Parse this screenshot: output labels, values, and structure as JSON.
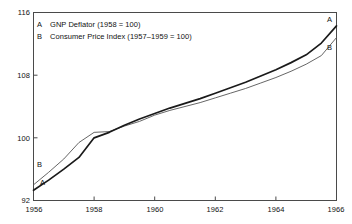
{
  "chart_data": {
    "type": "line",
    "title": "",
    "subtitle": "",
    "xlabel": "",
    "ylabel": "",
    "xlim": [
      1956,
      1966
    ],
    "ylim": [
      92,
      116
    ],
    "grid": false,
    "legend_position": "inside-top-left",
    "x_ticks": [
      "1956",
      "1958",
      "1960",
      "1962",
      "1964",
      "1966"
    ],
    "x_tick_values": [
      1956,
      1958,
      1960,
      1962,
      1964,
      1966
    ],
    "y_ticks": [
      "92",
      "100",
      "108",
      "116"
    ],
    "y_tick_values": [
      92,
      100,
      108,
      116
    ],
    "x": [
      1956,
      1956.5,
      1957,
      1957.5,
      1958,
      1958.5,
      1959,
      1959.5,
      1960,
      1960.5,
      1961,
      1961.5,
      1962,
      1962.5,
      1963,
      1963.5,
      1964,
      1964.5,
      1965,
      1965.5,
      1966
    ],
    "series": [
      {
        "name": "A",
        "label": "GNP Deflator (1958 = 100)",
        "key": "A",
        "color": "#1a1a1a",
        "line_width": 1.7,
        "start_label": "A",
        "end_label": "A",
        "values": [
          93.3,
          94.6,
          96.0,
          97.5,
          100.0,
          100.7,
          101.6,
          102.4,
          103.1,
          103.8,
          104.4,
          105.0,
          105.7,
          106.4,
          107.1,
          107.9,
          108.7,
          109.6,
          110.6,
          112.1,
          114.3
        ]
      },
      {
        "name": "B",
        "label": "Consumer Price Index (1957–1959 = 100)",
        "key": "B",
        "color": "#555555",
        "line_width": 0.9,
        "start_label": "B",
        "end_label": "B",
        "values": [
          94.0,
          95.6,
          97.3,
          99.4,
          100.7,
          100.8,
          101.5,
          102.1,
          102.9,
          103.5,
          104.0,
          104.5,
          105.1,
          105.7,
          106.3,
          107.0,
          107.7,
          108.5,
          109.4,
          110.5,
          112.8
        ]
      }
    ],
    "annotations": [
      {
        "text": "A",
        "series": "A",
        "position": "left-start"
      },
      {
        "text": "B",
        "series": "B",
        "position": "left-start"
      },
      {
        "text": "A",
        "series": "A",
        "position": "right-end"
      },
      {
        "text": "B",
        "series": "B",
        "position": "right-end"
      }
    ],
    "colors": {
      "background": "#ffffff",
      "frame": "#4a4a4a",
      "text": "#111111",
      "series_a": "#1a1a1a",
      "series_b": "#555555"
    }
  },
  "legend": {
    "rows": [
      {
        "key": "A",
        "text": "GNP Deflator (1958 = 100)"
      },
      {
        "key": "B",
        "text": "Consumer Price Index (1957–1959 = 100)"
      }
    ]
  },
  "axes": {
    "y_labels": [
      "116",
      "108",
      "100",
      "92"
    ],
    "x_labels": [
      "1956",
      "1958",
      "1960",
      "1962",
      "1964",
      "1966"
    ]
  },
  "curve_labels": {
    "a_left": "A",
    "b_left": "B",
    "a_right": "A",
    "b_right": "B"
  }
}
